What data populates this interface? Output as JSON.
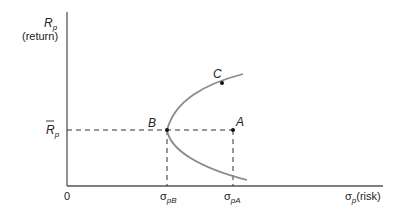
{
  "diagram": {
    "y_axis": {
      "symbol": "R",
      "subscript": "p",
      "label": "(return)"
    },
    "x_axis": {
      "origin_label": "0",
      "symbol": "σ",
      "subscript": "p",
      "label": "(risk)"
    },
    "r_bar_label": {
      "symbol": "R",
      "subscript": "p"
    },
    "points": [
      {
        "id": "A",
        "label": "A"
      },
      {
        "id": "B",
        "label": "B"
      },
      {
        "id": "C",
        "label": "C"
      }
    ],
    "x_ticks": [
      {
        "symbol": "σ",
        "subscript": "pB"
      },
      {
        "symbol": "σ",
        "subscript": "pA"
      }
    ],
    "colors": {
      "axis": "#555555",
      "curve": "#8a8a8a",
      "dash": "#333333",
      "point": "#111111",
      "text": "#222222"
    }
  }
}
